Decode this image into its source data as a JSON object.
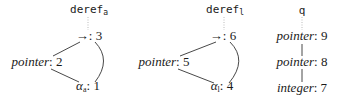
{
  "diagram": {
    "trees": [
      {
        "root": {
          "name": "deref",
          "subscript": "a"
        },
        "nodes": [
          {
            "kind": "→",
            "id": "3"
          },
          {
            "kind": "pointer",
            "id": "2"
          },
          {
            "kind": "α",
            "subscript": "a",
            "id": "1"
          }
        ]
      },
      {
        "root": {
          "name": "deref",
          "subscript": "l"
        },
        "nodes": [
          {
            "kind": "→",
            "id": "6"
          },
          {
            "kind": "pointer",
            "id": "5"
          },
          {
            "kind": "α",
            "subscript": "l",
            "id": "4"
          }
        ]
      },
      {
        "root": {
          "name": "q"
        },
        "nodes": [
          {
            "kind": "pointer",
            "id": "9"
          },
          {
            "kind": "pointer",
            "id": "8"
          },
          {
            "kind": "integer",
            "id": "7"
          }
        ]
      }
    ],
    "colors": {
      "text": "#1a1a1a",
      "edge": "#333333",
      "dotted": "#999999"
    }
  }
}
